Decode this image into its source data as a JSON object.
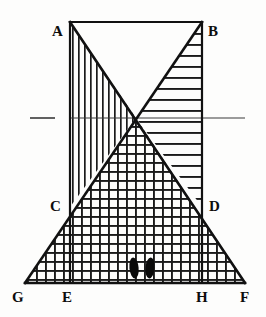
{
  "figure": {
    "type": "geometry-diagram",
    "title": "",
    "background_color": "#fdfdfc",
    "stroke_color": "#111111",
    "hatch_color": "#1a1a1a",
    "width": 266,
    "height": 317,
    "vertex_labels": [
      {
        "id": "A",
        "text": "A",
        "x": 52,
        "y": 24,
        "anchor_x": 70,
        "anchor_y": 22
      },
      {
        "id": "B",
        "text": "B",
        "x": 208,
        "y": 24,
        "anchor_x": 202,
        "anchor_y": 22
      },
      {
        "id": "C",
        "text": "C",
        "x": 50,
        "y": 199,
        "anchor_x": 70,
        "anchor_y": 207
      },
      {
        "id": "D",
        "text": "D",
        "x": 209,
        "y": 199,
        "anchor_x": 202,
        "anchor_y": 207
      },
      {
        "id": "G",
        "text": "G",
        "x": 12,
        "y": 290,
        "anchor_x": 25,
        "anchor_y": 283
      },
      {
        "id": "E",
        "text": "E",
        "x": 62,
        "y": 290,
        "anchor_x": 70,
        "anchor_y": 283
      },
      {
        "id": "H",
        "text": "H",
        "x": 196,
        "y": 290,
        "anchor_x": 202,
        "anchor_y": 283
      },
      {
        "id": "F",
        "text": "F",
        "x": 240,
        "y": 290,
        "anchor_x": 245,
        "anchor_y": 283
      }
    ],
    "points": {
      "A": {
        "x": 70,
        "y": 22
      },
      "B": {
        "x": 202,
        "y": 22
      },
      "C": {
        "x": 70,
        "y": 207
      },
      "D": {
        "x": 202,
        "y": 207
      },
      "E": {
        "x": 70,
        "y": 283
      },
      "F": {
        "x": 245,
        "y": 283
      },
      "G": {
        "x": 25,
        "y": 283
      },
      "H": {
        "x": 202,
        "y": 283
      },
      "X": {
        "x": 136,
        "y": 118
      }
    },
    "segments": [
      {
        "name": "top-edge-AB",
        "from": "A",
        "to": "B",
        "width": 2.2
      },
      {
        "name": "left-vertical-AE",
        "from": "A",
        "to": "E",
        "width": 2.2
      },
      {
        "name": "right-vertical-BH",
        "from": "B",
        "to": "H",
        "width": 2.2
      },
      {
        "name": "bottom-edge-GF",
        "from": "G",
        "to": "F",
        "width": 2.4
      },
      {
        "name": "diagonal-AF",
        "from": "A",
        "to": "F",
        "width": 2.6
      },
      {
        "name": "diagonal-GB",
        "from": "G",
        "to": "B",
        "width": 2.6
      }
    ],
    "axis_line": {
      "name": "horizon-line",
      "y": 118,
      "left_dash_start": 30,
      "left_dash_end": 55,
      "main_start": 70,
      "main_end": 245,
      "width": 1.2
    },
    "hatch_regions": [
      {
        "name": "upper-left-vertical-hatch",
        "pattern": "vertical",
        "spacing": 6,
        "line_width": 1.7
      },
      {
        "name": "upper-right-horizontal-hatch",
        "pattern": "horizontal",
        "spacing": 11,
        "line_width": 1.9
      },
      {
        "name": "lower-cross-hatch",
        "pattern": "cross",
        "spacing": 9,
        "line_width": 2.0
      }
    ],
    "footprints": [
      {
        "name": "left-footprint",
        "cx": 134,
        "cy": 268,
        "rx": 4.6,
        "ry": 10.5,
        "rotate": -6
      },
      {
        "name": "right-footprint",
        "cx": 150,
        "cy": 268,
        "rx": 4.6,
        "ry": 10.5,
        "rotate": 5
      }
    ]
  }
}
